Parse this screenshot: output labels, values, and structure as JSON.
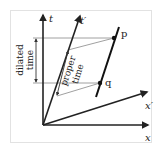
{
  "diagram": {
    "type": "spacetime-diagram",
    "axes": {
      "t": {
        "label": "t"
      },
      "t_prime": {
        "label": "t′"
      },
      "x": {
        "label": "x"
      },
      "x_prime": {
        "label": "x′"
      }
    },
    "events": [
      {
        "id": "p",
        "label": "p"
      },
      {
        "id": "q",
        "label": "q"
      }
    ],
    "annotations": {
      "dilated_time": {
        "line1": "dilated",
        "line2": "time"
      },
      "proper_time": {
        "line1": "proper",
        "line2": "time"
      }
    },
    "colors": {
      "axis": "#222222",
      "worldline": "#111111",
      "guide": "#888888",
      "frame": "#e2e2e2"
    }
  }
}
